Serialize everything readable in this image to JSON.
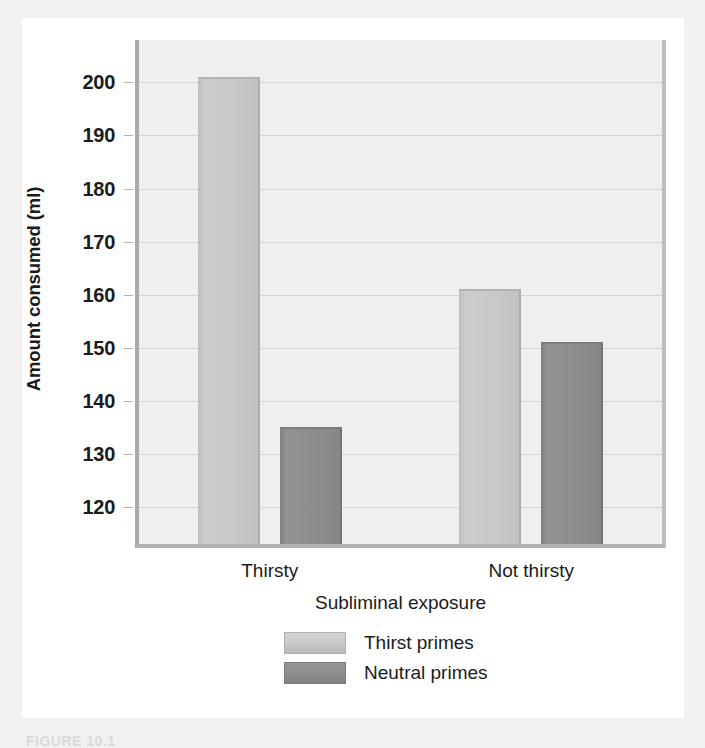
{
  "chart_data": {
    "type": "bar",
    "title": "",
    "xlabel": "Subliminal exposure",
    "ylabel": "Amount consumed (ml)",
    "categories": [
      "Thirsty",
      "Not thirsty"
    ],
    "series": [
      {
        "name": "Thirst primes",
        "values": [
          201,
          161
        ],
        "color": "#c9c8c7"
      },
      {
        "name": "Neutral primes",
        "values": [
          135,
          151
        ],
        "color": "#8e8d8c"
      }
    ],
    "ylim": [
      113,
      208
    ],
    "yticks": [
      120,
      130,
      140,
      150,
      160,
      170,
      180,
      190,
      200
    ],
    "ytick_labels": [
      "120",
      "130",
      "140",
      "150",
      "160",
      "170",
      "180",
      "190",
      "200"
    ],
    "grid": true,
    "legend_position": "below-center"
  },
  "axes": {
    "y_title": "Amount consumed (ml)",
    "x_title": "Subliminal exposure"
  },
  "legend": {
    "items": [
      {
        "label": "Thirst primes",
        "swatch": "light"
      },
      {
        "label": "Neutral primes",
        "swatch": "dark"
      }
    ]
  },
  "caption": {
    "text": "FIGURE 10.1"
  }
}
